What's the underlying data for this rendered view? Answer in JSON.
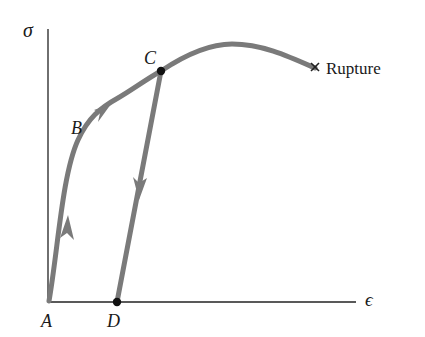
{
  "diagram": {
    "axes": {
      "y_label": "σ",
      "x_label": "ϵ"
    },
    "points": {
      "A": "A",
      "B": "B",
      "C": "C",
      "D": "D"
    },
    "rupture_label": "Rupture",
    "rupture_marker": "×",
    "colors": {
      "curve": "#7a7a7a",
      "axis": "#222222",
      "point": "#111111",
      "text": "#1a1a1a"
    }
  }
}
